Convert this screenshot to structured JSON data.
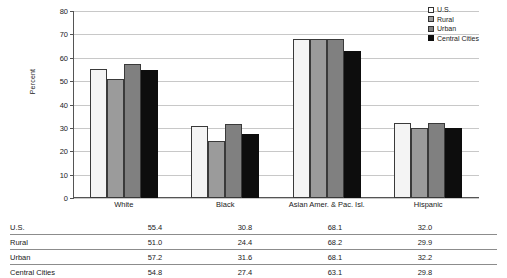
{
  "chart_data": {
    "type": "bar",
    "title": "",
    "xlabel": "",
    "ylabel": "Percent",
    "ylim": [
      0,
      80
    ],
    "yticks": [
      0,
      10,
      20,
      30,
      40,
      50,
      60,
      70,
      80
    ],
    "grid": true,
    "legend_position": "top-right",
    "categories": [
      "White",
      "Black",
      "Asian Amer. & Pac. Isl.",
      "Hispanic"
    ],
    "series": [
      {
        "name": "U.S.",
        "color": "#f4f4f4",
        "values": [
          55.4,
          30.8,
          68.1,
          32.0
        ]
      },
      {
        "name": "Rural",
        "color": "#9b9b9b",
        "values": [
          51.0,
          24.4,
          68.2,
          29.9
        ]
      },
      {
        "name": "Urban",
        "color": "#808080",
        "values": [
          57.2,
          31.6,
          68.1,
          32.2
        ]
      },
      {
        "name": "Central Cities",
        "color": "#0d0d0d",
        "values": [
          54.8,
          27.4,
          63.1,
          29.8
        ]
      }
    ]
  },
  "legend": {
    "items": [
      {
        "label": "U.S."
      },
      {
        "label": "Rural"
      },
      {
        "label": "Urban"
      },
      {
        "label": "Central Cities"
      }
    ]
  },
  "axis": {
    "y_label": "Percent",
    "y_ticks": [
      "80",
      "70",
      "60",
      "50",
      "40",
      "30",
      "20",
      "10",
      "0"
    ]
  },
  "categories": [
    {
      "label": "White"
    },
    {
      "label": "Black"
    },
    {
      "label": "Asian Amer. & Pac. Isl."
    },
    {
      "label": "Hispanic"
    }
  ],
  "table": {
    "rows": [
      {
        "label": "U.S.",
        "cells": [
          "55.4",
          "30.8",
          "68.1",
          "32.0"
        ]
      },
      {
        "label": "Rural",
        "cells": [
          "51.0",
          "24.4",
          "68.2",
          "29.9"
        ]
      },
      {
        "label": "Urban",
        "cells": [
          "57.2",
          "31.6",
          "68.1",
          "32.2"
        ]
      },
      {
        "label": "Central Cities",
        "cells": [
          "54.8",
          "27.4",
          "63.1",
          "29.8"
        ]
      }
    ]
  }
}
